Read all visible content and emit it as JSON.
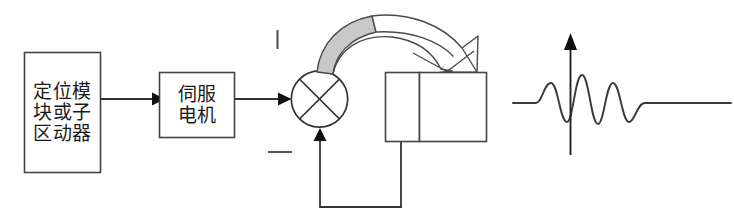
{
  "diagram": {
    "type": "block-diagram",
    "background_color": "#ffffff",
    "stroke_color": "#333333",
    "text_color": "#1a1a1a",
    "accent_fill": "#c9c9c9",
    "blocks": [
      {
        "id": "positioning-module",
        "name": "positioning-module-block",
        "lines": [
          "定位模",
          "块或子",
          "区动器"
        ],
        "x": 24,
        "y": 52,
        "w": 77,
        "h": 121
      },
      {
        "id": "servo-motor",
        "name": "servo-motor-block",
        "lines": [
          "伺服",
          "电机"
        ],
        "x": 159,
        "y": 72,
        "w": 76,
        "h": 66
      }
    ],
    "summing_junction": {
      "name": "summing-junction",
      "shape": "circle-with-cross",
      "cx": 319.5,
      "cy": 99,
      "r": 28.5
    },
    "load_boxes": [
      {
        "name": "load-box-left",
        "x": 385,
        "y": 72,
        "w": 35,
        "h": 70
      },
      {
        "name": "load-box-right",
        "x": 420,
        "y": 72,
        "w": 67,
        "h": 70
      }
    ],
    "sign_marks": [
      {
        "name": "plus-sign-mark",
        "orientation": "vertical",
        "x": 277,
        "y": 30,
        "length": 19
      },
      {
        "name": "minus-sign-mark",
        "orientation": "horizontal",
        "x": 268,
        "y": 152,
        "length": 24
      }
    ],
    "connectors": [
      {
        "name": "connector-module-to-servo",
        "from": "positioning-module",
        "to": "servo-motor",
        "arrow": true
      },
      {
        "name": "connector-servo-to-junction",
        "from": "servo-motor",
        "to": "summing-junction",
        "arrow": true
      },
      {
        "name": "curved-rotation-arrow",
        "from": "summing-junction",
        "to": "load-box-right",
        "style": "curved-banded-arrow",
        "filled_half": true
      },
      {
        "name": "feedback-path",
        "from": "load-box-left",
        "to": "summing-junction",
        "arrow": true,
        "route": "down-left-up"
      }
    ],
    "waveform": {
      "name": "vibration-response-waveform",
      "type": "damped-oscillation",
      "baseline_y": 103,
      "x_start": 513,
      "x_end": 731,
      "axis_arrow": {
        "name": "waveform-axis-arrow",
        "x": 570,
        "y_top": 40,
        "y_bottom": 155
      }
    }
  }
}
